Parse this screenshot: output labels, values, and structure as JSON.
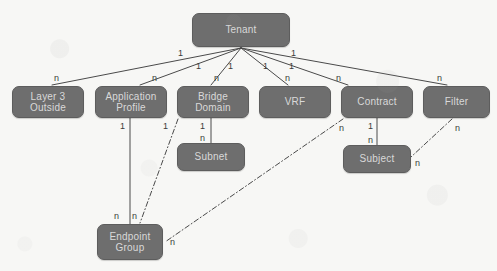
{
  "diagram": {
    "background_color": "#f7f7f5",
    "node_fill_color": "#6e6e6e",
    "node_text_color": "#d9d9d9",
    "edge_color": "#4a4a4a",
    "nodes": [
      {
        "id": "tenant",
        "label": "Tenant",
        "x": 192,
        "y": 13,
        "w": 98,
        "h": 34
      },
      {
        "id": "layer3-outside",
        "label": "Layer 3\nOutside",
        "x": 12,
        "y": 86,
        "w": 72,
        "h": 32
      },
      {
        "id": "application-profile",
        "label": "Application\nProfile",
        "x": 95,
        "y": 86,
        "w": 72,
        "h": 32
      },
      {
        "id": "bridge-domain",
        "label": "Bridge\nDomain",
        "x": 177,
        "y": 86,
        "w": 72,
        "h": 32
      },
      {
        "id": "vrf",
        "label": "VRF",
        "x": 259,
        "y": 86,
        "w": 72,
        "h": 32
      },
      {
        "id": "contract",
        "label": "Contract",
        "x": 341,
        "y": 86,
        "w": 72,
        "h": 32
      },
      {
        "id": "filter",
        "label": "Filter",
        "x": 423,
        "y": 86,
        "w": 67,
        "h": 32
      },
      {
        "id": "subnet",
        "label": "Subnet",
        "x": 177,
        "y": 143,
        "w": 68,
        "h": 28
      },
      {
        "id": "subject",
        "label": "Subject",
        "x": 343,
        "y": 145,
        "w": 68,
        "h": 28
      },
      {
        "id": "endpoint-group",
        "label": "Endpoint\nGroup",
        "x": 97,
        "y": 224,
        "w": 66,
        "h": 36
      }
    ],
    "edges": [
      {
        "id": "tenant-to-layer3-outside",
        "from": "tenant",
        "to": "layer3-outside",
        "style": "solid",
        "from_mult": "1",
        "to_mult": "n"
      },
      {
        "id": "tenant-to-application-profile",
        "from": "tenant",
        "to": "application-profile",
        "style": "solid",
        "from_mult": "1",
        "to_mult": "n"
      },
      {
        "id": "tenant-to-bridge-domain",
        "from": "tenant",
        "to": "bridge-domain",
        "style": "solid",
        "from_mult": "1",
        "to_mult": "n"
      },
      {
        "id": "tenant-to-vrf",
        "from": "tenant",
        "to": "vrf",
        "style": "solid",
        "from_mult": "1",
        "to_mult": "n"
      },
      {
        "id": "tenant-to-contract",
        "from": "tenant",
        "to": "contract",
        "style": "solid",
        "from_mult": "1",
        "to_mult": "n"
      },
      {
        "id": "tenant-to-filter",
        "from": "tenant",
        "to": "filter",
        "style": "solid",
        "from_mult": "1",
        "to_mult": "n"
      },
      {
        "id": "application-profile-to-endpoint-group",
        "from": "application-profile",
        "to": "endpoint-group",
        "style": "solid",
        "from_mult": "1",
        "to_mult": "n"
      },
      {
        "id": "bridge-domain-to-subnet",
        "from": "bridge-domain",
        "to": "subnet",
        "style": "solid",
        "from_mult": "1",
        "to_mult": "n"
      },
      {
        "id": "contract-to-subject",
        "from": "contract",
        "to": "subject",
        "style": "solid",
        "from_mult": "1",
        "to_mult": "n"
      },
      {
        "id": "bridge-domain-to-endpoint-group",
        "from": "bridge-domain",
        "to": "endpoint-group",
        "style": "dash-dot",
        "from_mult": "1",
        "to_mult": "n"
      },
      {
        "id": "contract-to-endpoint-group",
        "from": "contract",
        "to": "endpoint-group",
        "style": "dash-dot",
        "from_mult": "n",
        "to_mult": "n"
      },
      {
        "id": "filter-to-subject",
        "from": "filter",
        "to": "subject",
        "style": "dash-dot",
        "from_mult": "n",
        "to_mult": "n"
      }
    ],
    "multiplicity_labels": [
      {
        "id": "m-tenant-l3out",
        "text": "1",
        "x": 178,
        "y": 49
      },
      {
        "id": "m-tenant-ap",
        "text": "1",
        "x": 196,
        "y": 62
      },
      {
        "id": "m-tenant-bd",
        "text": "1",
        "x": 228,
        "y": 62
      },
      {
        "id": "m-tenant-vrf",
        "text": "1",
        "x": 263,
        "y": 62
      },
      {
        "id": "m-tenant-ctr",
        "text": "1",
        "x": 289,
        "y": 62
      },
      {
        "id": "m-tenant-flt",
        "text": "1",
        "x": 291,
        "y": 49
      },
      {
        "id": "m-l3out-n",
        "text": "n",
        "x": 54,
        "y": 74
      },
      {
        "id": "m-ap-n",
        "text": "n",
        "x": 152,
        "y": 74
      },
      {
        "id": "m-bd-n",
        "text": "n",
        "x": 214,
        "y": 74
      },
      {
        "id": "m-vrf-n",
        "text": "n",
        "x": 285,
        "y": 74
      },
      {
        "id": "m-ctr-n",
        "text": "n",
        "x": 336,
        "y": 74
      },
      {
        "id": "m-flt-n",
        "text": "n",
        "x": 437,
        "y": 74
      },
      {
        "id": "m-ap-1",
        "text": "1",
        "x": 120,
        "y": 122
      },
      {
        "id": "m-bd-1-epg",
        "text": "1",
        "x": 163,
        "y": 122
      },
      {
        "id": "m-bd-1-subnet",
        "text": "1",
        "x": 200,
        "y": 122
      },
      {
        "id": "m-subnet-n",
        "text": "n",
        "x": 200,
        "y": 134
      },
      {
        "id": "m-ctr-n-epg",
        "text": "n",
        "x": 339,
        "y": 124
      },
      {
        "id": "m-ctr-1-subj",
        "text": "1",
        "x": 368,
        "y": 122
      },
      {
        "id": "m-subj-n",
        "text": "n",
        "x": 368,
        "y": 136
      },
      {
        "id": "m-flt-n-subj",
        "text": "n",
        "x": 455,
        "y": 124
      },
      {
        "id": "m-subj-n-right",
        "text": "n",
        "x": 415,
        "y": 159
      },
      {
        "id": "m-epg-n-ap",
        "text": "n",
        "x": 114,
        "y": 212
      },
      {
        "id": "m-epg-n-bd",
        "text": "n",
        "x": 132,
        "y": 212
      },
      {
        "id": "m-epg-n-ctr",
        "text": "n",
        "x": 170,
        "y": 238
      }
    ]
  }
}
